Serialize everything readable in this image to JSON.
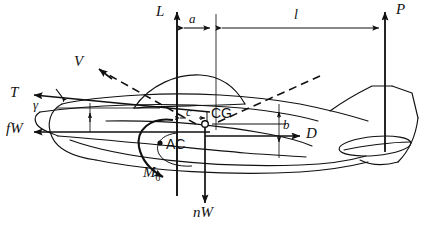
{
  "figure": {
    "kind": "aircraft-force-balance-diagram",
    "width": 439,
    "height": 231,
    "background_color": "#ffffff",
    "ink_color": "#111111"
  },
  "forces": {
    "lift": {
      "label": "L",
      "style": "italic",
      "direction": "up",
      "x": 177,
      "y_tail": 118,
      "y_head": 10
    },
    "tail_load": {
      "label": "P",
      "style": "italic",
      "direction": "up",
      "x": 385,
      "y_tail": 150,
      "y_head": 10
    },
    "thrust": {
      "label": "T",
      "style": "italic",
      "direction": "left",
      "y": 96
    },
    "drag": {
      "label": "D",
      "style": "italic",
      "direction": "right",
      "y": 135
    },
    "inertia_horizontal": {
      "label": "fW",
      "style": "italic",
      "direction": "left",
      "y": 132
    },
    "inertia_vertical": {
      "label": "nW",
      "style": "italic",
      "direction": "down",
      "x": 205,
      "y_head": 203
    },
    "velocity": {
      "label": "V",
      "style": "italic",
      "direction": "up-left",
      "dashed": true
    },
    "pitching_moment": {
      "label": "M",
      "subscript": "0",
      "style": "italic",
      "sense": "counterclockwise"
    }
  },
  "points": {
    "center_of_gravity": {
      "label": "CG",
      "style": "upright",
      "marker": "open-circle",
      "x": 212,
      "y": 124
    },
    "aerodynamic_center": {
      "label": "AC",
      "style": "upright",
      "marker": "filled-dot",
      "x": 167,
      "y": 142
    }
  },
  "angles": {
    "flight_path": {
      "label": "γ",
      "style": "italic",
      "location": "between thrust line and horizontal reference"
    }
  },
  "dimensions": [
    {
      "label": "a",
      "style": "italic",
      "orientation": "horizontal",
      "from_x": 177,
      "to_x": 216,
      "y": 28,
      "text_x": 190,
      "text_y": 17
    },
    {
      "label": "l",
      "style": "italic",
      "orientation": "horizontal",
      "from_x": 219,
      "to_x": 385,
      "y": 28,
      "text_x": 296,
      "text_y": 15
    },
    {
      "label": "c",
      "style": "italic",
      "orientation": "horizontal",
      "from_x": 177,
      "to_x": 207,
      "y": 118,
      "text_x": 188,
      "text_y": 110
    },
    {
      "label": "b",
      "style": "italic",
      "orientation": "vertical",
      "x": 279,
      "from_y": 112,
      "to_y": 148,
      "text_x": 283,
      "text_y": 124
    }
  ],
  "labels": {
    "L": "L",
    "P": "P",
    "T": "T",
    "D": "D",
    "V": "V",
    "fW": "fW",
    "nW": "nW",
    "M": "M",
    "M_sub": "0",
    "CG": "CG",
    "AC": "AC",
    "gamma": "γ",
    "a": "a",
    "l": "l",
    "c": "c",
    "b": "b"
  }
}
